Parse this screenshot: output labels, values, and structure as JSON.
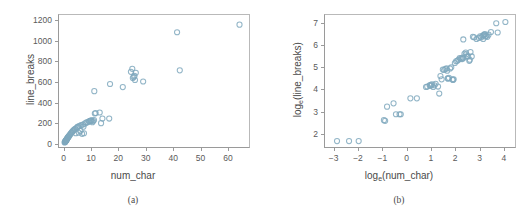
{
  "figure": {
    "panel_a_caption": "(a)",
    "panel_b_caption": "(b)",
    "marker_color": "#7fa8bd",
    "axis_color": "#9a9a9a",
    "background": "#ffffff"
  },
  "panel_a": {
    "xlabel": "num_char",
    "ylabel": "line_breaks",
    "xticks": [
      "0",
      "10",
      "20",
      "30",
      "40",
      "50",
      "60"
    ],
    "yticks": [
      "0",
      "200",
      "400",
      "600",
      "800",
      "1000",
      "1200"
    ]
  },
  "panel_b": {
    "xlabel_base": "log",
    "xlabel_sub": "e",
    "xlabel_arg": "(num_char)",
    "ylabel_base": "log",
    "ylabel_sub": "e",
    "ylabel_arg": "(line_breaks)",
    "xticks": [
      "-3",
      "-2",
      "-1",
      "0",
      "1",
      "2",
      "3",
      "4"
    ],
    "yticks": [
      "2",
      "3",
      "4",
      "5",
      "6",
      "7"
    ]
  },
  "chart_data": [
    {
      "type": "scatter",
      "title": "",
      "panel": "(a)",
      "xlabel": "num_char",
      "ylabel": "line_breaks",
      "xlim": [
        -2,
        68
      ],
      "ylim": [
        -40,
        1260
      ],
      "xticks": [
        0,
        10,
        20,
        30,
        40,
        50,
        60
      ],
      "yticks": [
        0,
        200,
        400,
        600,
        800,
        1000,
        1200
      ],
      "grid": false,
      "legend": "none",
      "marker": "open-circle",
      "marker_color": "#7fa8bd",
      "x": [
        0.06,
        0.18,
        0.25,
        0.3,
        0.35,
        0.4,
        0.45,
        0.5,
        0.55,
        0.6,
        0.7,
        0.75,
        0.8,
        0.85,
        0.9,
        1.0,
        1.1,
        1.2,
        1.3,
        1.4,
        1.5,
        1.6,
        1.8,
        2.0,
        2.2,
        2.4,
        2.6,
        2.8,
        3.0,
        3.2,
        3.5,
        3.8,
        4.0,
        4.2,
        4.5,
        4.8,
        5.0,
        5.3,
        5.6,
        5.9,
        6.2,
        6.5,
        6.8,
        7.0,
        7.2,
        7.5,
        8.0,
        8.5,
        9.0,
        9.3,
        9.5,
        9.8,
        10.0,
        10.3,
        10.6,
        10.9,
        11.2,
        11.5,
        13.0,
        13.5,
        14.0,
        16.5,
        11.0,
        16.8,
        21.5,
        24.5,
        25.0,
        25.2,
        25.5,
        25.8,
        26.0,
        26.3,
        29.0,
        41.5,
        42.5,
        64.5
      ],
      "y": [
        5,
        8,
        10,
        12,
        14,
        16,
        18,
        20,
        22,
        25,
        28,
        30,
        33,
        35,
        38,
        42,
        46,
        50,
        54,
        58,
        62,
        66,
        72,
        80,
        88,
        95,
        100,
        108,
        115,
        120,
        128,
        135,
        140,
        95,
        150,
        155,
        160,
        100,
        168,
        118,
        175,
        90,
        182,
        160,
        95,
        190,
        200,
        205,
        210,
        215,
        218,
        220,
        222,
        205,
        215,
        225,
        290,
        295,
        300,
        195,
        240,
        240,
        510,
        580,
        550,
        700,
        730,
        640,
        650,
        660,
        620,
        690,
        605,
        1090,
        715,
        1165
      ]
    },
    {
      "type": "scatter",
      "title": "",
      "panel": "(b)",
      "xlabel": "log_e(num_char)",
      "ylabel": "log_e(line_breaks)",
      "xlim": [
        -3.4,
        4.5
      ],
      "ylim": [
        1.35,
        7.4
      ],
      "xticks": [
        -3,
        -2,
        -1,
        0,
        1,
        2,
        3,
        4
      ],
      "yticks": [
        2,
        3,
        4,
        5,
        6,
        7
      ],
      "grid": false,
      "legend": "none",
      "marker": "open-circle",
      "marker_color": "#7fa8bd",
      "x": [
        -2.9,
        -2.4,
        -2.0,
        -0.95,
        -0.9,
        -0.82,
        -0.55,
        -0.45,
        -0.3,
        -0.25,
        0.15,
        0.42,
        0.8,
        0.85,
        0.95,
        1.0,
        1.05,
        1.1,
        1.15,
        1.2,
        1.3,
        1.4,
        1.45,
        1.5,
        1.55,
        1.6,
        1.65,
        1.7,
        1.72,
        1.75,
        1.8,
        1.85,
        1.9,
        1.95,
        2.0,
        2.05,
        2.1,
        2.15,
        2.2,
        2.25,
        2.3,
        2.32,
        2.35,
        2.4,
        2.45,
        2.5,
        2.55,
        2.6,
        2.65,
        2.7,
        2.75,
        2.8,
        2.9,
        3.0,
        3.05,
        3.1,
        3.15,
        3.2,
        3.22,
        3.25,
        3.27,
        3.3,
        3.35,
        3.4,
        3.5,
        3.72,
        3.78,
        4.1,
        2.35,
        1.35,
        1.68,
        1.92,
        2.48,
        0.98,
        2.62,
        3.18
      ],
      "y": [
        1.62,
        1.62,
        1.62,
        2.58,
        2.55,
        3.2,
        3.35,
        2.85,
        2.85,
        2.85,
        3.58,
        3.58,
        4.1,
        4.12,
        4.18,
        4.2,
        4.22,
        4.1,
        4.18,
        4.25,
        4.12,
        4.6,
        4.45,
        4.9,
        4.88,
        4.92,
        4.95,
        4.5,
        4.48,
        4.52,
        4.95,
        5.0,
        4.45,
        4.45,
        5.2,
        5.28,
        5.3,
        5.35,
        5.42,
        5.4,
        5.38,
        5.45,
        5.42,
        5.62,
        5.68,
        5.5,
        5.5,
        5.3,
        5.7,
        5.5,
        6.4,
        6.38,
        6.3,
        6.35,
        6.42,
        6.38,
        6.45,
        6.48,
        6.5,
        6.52,
        6.42,
        6.45,
        6.4,
        6.5,
        6.62,
        7.02,
        6.6,
        7.08,
        6.28,
        3.8,
        4.85,
        4.42,
        5.6,
        4.15,
        5.35,
        6.3
      ]
    }
  ]
}
